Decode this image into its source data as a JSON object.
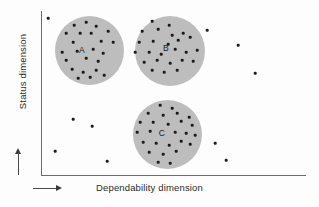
{
  "chart_data": {
    "type": "scatter",
    "title": "",
    "xlabel": "Dependability dimension",
    "ylabel": "Status dimension",
    "grid": false,
    "legend": "none",
    "axis_arrows": {
      "x_direction": "right",
      "y_direction": "up"
    },
    "xlim": [
      0,
      100
    ],
    "ylim": [
      0,
      100
    ],
    "axes_ticks": {
      "x": [],
      "y": []
    },
    "cluster_fill_color": "#bdbdbd",
    "point_color": "#1b1b1b",
    "axis_color": "#6b6b6b",
    "clusters": [
      {
        "label": "A",
        "cx": 89.5,
        "cy": 50.5,
        "r": 34.5,
        "label_x": 82,
        "label_y": 50,
        "points": [
          [
            74,
            25
          ],
          [
            86,
            22
          ],
          [
            96,
            26
          ],
          [
            66,
            33
          ],
          [
            80,
            33
          ],
          [
            91,
            33
          ],
          [
            108,
            31
          ],
          [
            73,
            42
          ],
          [
            101,
            41
          ],
          [
            113,
            42
          ],
          [
            62,
            52
          ],
          [
            77,
            51
          ],
          [
            93,
            49
          ],
          [
            103,
            53
          ],
          [
            66,
            60
          ],
          [
            86,
            58
          ],
          [
            98,
            61
          ],
          [
            72,
            69
          ],
          [
            83,
            72
          ],
          [
            96,
            70
          ],
          [
            78,
            78
          ],
          [
            90,
            77
          ],
          [
            104,
            75
          ]
        ]
      },
      {
        "label": "B",
        "cx": 170,
        "cy": 51,
        "r": 35,
        "label_x": 166,
        "label_y": 48,
        "points": [
          [
            152,
            21
          ],
          [
            169,
            25
          ],
          [
            142,
            31
          ],
          [
            158,
            29
          ],
          [
            172,
            35
          ],
          [
            183,
            33
          ],
          [
            139,
            42
          ],
          [
            153,
            41
          ],
          [
            168,
            44
          ],
          [
            178,
            40
          ],
          [
            190,
            37
          ],
          [
            135,
            52
          ],
          [
            149,
            52
          ],
          [
            161,
            54
          ],
          [
            175,
            49
          ],
          [
            186,
            52
          ],
          [
            197,
            50
          ],
          [
            144,
            62
          ],
          [
            157,
            60
          ],
          [
            170,
            63
          ],
          [
            182,
            60
          ],
          [
            193,
            61
          ],
          [
            152,
            70
          ],
          [
            164,
            72
          ],
          [
            177,
            70
          ]
        ]
      },
      {
        "label": "C",
        "cx": 167,
        "cy": 134.5,
        "r": 34.5,
        "label_x": 162,
        "label_y": 133,
        "points": [
          [
            160,
            105
          ],
          [
            172,
            108
          ],
          [
            148,
            113
          ],
          [
            163,
            115
          ],
          [
            177,
            113
          ],
          [
            189,
            117
          ],
          [
            140,
            122
          ],
          [
            153,
            122
          ],
          [
            168,
            124
          ],
          [
            181,
            121
          ],
          [
            192,
            125
          ],
          [
            137,
            132
          ],
          [
            150,
            131
          ],
          [
            175,
            132
          ],
          [
            186,
            133
          ],
          [
            195,
            135
          ],
          [
            143,
            142
          ],
          [
            156,
            143
          ],
          [
            169,
            145
          ],
          [
            181,
            141
          ],
          [
            190,
            144
          ],
          [
            149,
            152
          ],
          [
            163,
            154
          ],
          [
            176,
            151
          ],
          [
            158,
            162
          ],
          [
            170,
            163
          ]
        ]
      }
    ],
    "outliers": [
      [
        48,
        18
      ],
      [
        207,
        30
      ],
      [
        238,
        45
      ],
      [
        255,
        73
      ],
      [
        73,
        119
      ],
      [
        92,
        126
      ],
      [
        55,
        151
      ],
      [
        107,
        161
      ],
      [
        215,
        143
      ],
      [
        226,
        160
      ]
    ]
  }
}
